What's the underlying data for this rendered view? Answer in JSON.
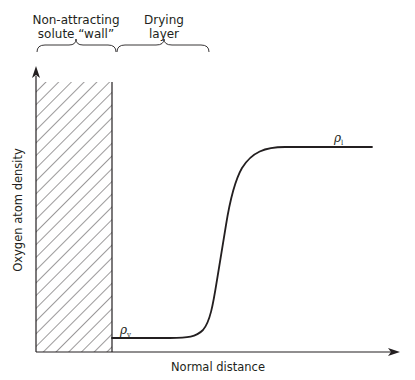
{
  "diagram": {
    "annotations": {
      "wall_label_line1": "Non-attracting",
      "wall_label_line2": "solute “wall”",
      "drying_label_line1": "Drying",
      "drying_label_line2": "layer"
    },
    "axes": {
      "y_label": "Oxygen atom density",
      "x_label": "Normal distance"
    },
    "curve_labels": {
      "vapor_symbol": "ρ",
      "vapor_subscript": "v",
      "liquid_symbol": "ρ",
      "liquid_subscript": "l"
    },
    "colors": {
      "ink": "#231f20",
      "background": "#ffffff"
    }
  }
}
